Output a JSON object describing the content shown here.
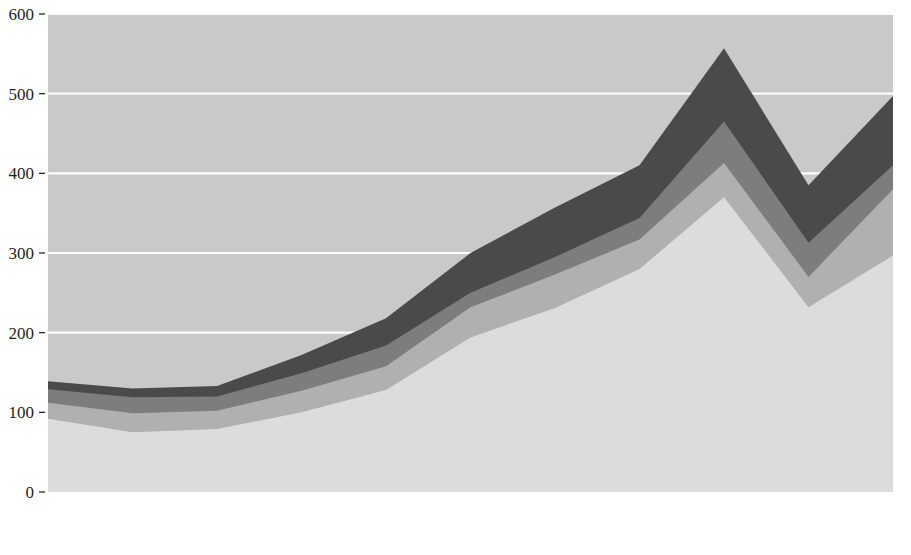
{
  "chart_data": {
    "type": "area",
    "stacked": true,
    "title": "",
    "xlabel": "",
    "ylabel": "",
    "grid": true,
    "grid_color": "#ffffff",
    "plot_bg": "#c9c9c9",
    "legend_position": "bottom",
    "ylim": [
      0,
      600
    ],
    "xlim": [
      "2000",
      "2010"
    ],
    "categories": [
      "2000",
      "2001",
      "2002",
      "2003",
      "2004",
      "2005",
      "2006",
      "2007",
      "2008",
      "2009",
      "2010"
    ],
    "y_ticks": [
      0,
      100,
      200,
      300,
      400,
      500,
      600
    ],
    "x_ticks": [
      "2000",
      "2001",
      "2002",
      "2003",
      "2004",
      "2005",
      "2006",
      "2007",
      "2008",
      "2009",
      "2010"
    ],
    "series": [
      {
        "name": "Fuels",
        "color": "#dcdcdc",
        "values": [
          92,
          75,
          79,
          100,
          128,
          194,
          231,
          280,
          370,
          232,
          297
        ]
      },
      {
        "name": "All food items",
        "color": "#b0b0b0",
        "values": [
          20,
          24,
          23,
          27,
          30,
          38,
          42,
          37,
          43,
          38,
          83
        ]
      },
      {
        "name": "Primary commodities, less food and fuel",
        "color": "#7d7d7d",
        "values": [
          17,
          20,
          18,
          22,
          26,
          18,
          22,
          27,
          52,
          43,
          30
        ]
      },
      {
        "name": "Manufactured goods",
        "color": "#4a4a4a",
        "values": [
          10,
          11,
          13,
          23,
          34,
          50,
          62,
          66,
          92,
          72,
          87
        ]
      }
    ],
    "stacked_totals": {
      "Fuels": [
        92,
        75,
        79,
        100,
        128,
        194,
        231,
        280,
        370,
        232,
        297
      ],
      "plus_food": [
        112,
        99,
        102,
        127,
        158,
        232,
        273,
        317,
        413,
        270,
        380
      ],
      "plus_primary": [
        129,
        119,
        120,
        149,
        184,
        250,
        295,
        344,
        465,
        313,
        410
      ],
      "plus_manufactured": [
        139,
        130,
        133,
        172,
        218,
        300,
        357,
        410,
        557,
        385,
        497
      ]
    }
  },
  "legend": {
    "items": [
      {
        "label": "Fuels",
        "color": "#dcdcdc"
      },
      {
        "label": "All food items",
        "color": "#b0b0b0"
      },
      {
        "label": "Primary commodities, less food and fuel",
        "color": "#7d7d7d"
      },
      {
        "label": "Manufactured goods",
        "color": "#4a4a4a"
      }
    ]
  },
  "axis": {
    "y_labels": [
      "600",
      "500",
      "400",
      "300",
      "200",
      "100",
      "0"
    ],
    "x_labels": [
      "2000",
      "2001",
      "2002",
      "2003",
      "2004",
      "2005",
      "2006",
      "2007",
      "2008",
      "2009",
      "2010"
    ]
  }
}
